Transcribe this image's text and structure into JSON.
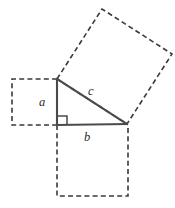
{
  "figure": {
    "name": "pythagorean-theorem-diagram",
    "background_color": "#ffffff",
    "solid_stroke_color": "#4a4a4a",
    "dashed_stroke_color": "#3a3a3a",
    "label_color": "#2b2b2b",
    "triangle": {
      "vertices": {
        "apex": {
          "x": 57,
          "y": 79
        },
        "right_angle": {
          "x": 57,
          "y": 125
        },
        "right": {
          "x": 127,
          "y": 124
        }
      },
      "right_angle_marker": {
        "x": 58,
        "y": 116,
        "size": 9
      }
    },
    "labels": {
      "leg_vertical": "a",
      "hypotenuse": "c",
      "leg_horizontal": "b"
    },
    "squares": {
      "on_leg_a": {
        "style": "dashed",
        "points": "57,79 12,79 12,125 57,125"
      },
      "on_leg_b": {
        "style": "dashed",
        "points": "57,125 57,196 128,196 128,125"
      },
      "on_hypotenuse_c": {
        "style": "dashed",
        "points": "57,79 102,9 172,54 127,124"
      }
    }
  }
}
